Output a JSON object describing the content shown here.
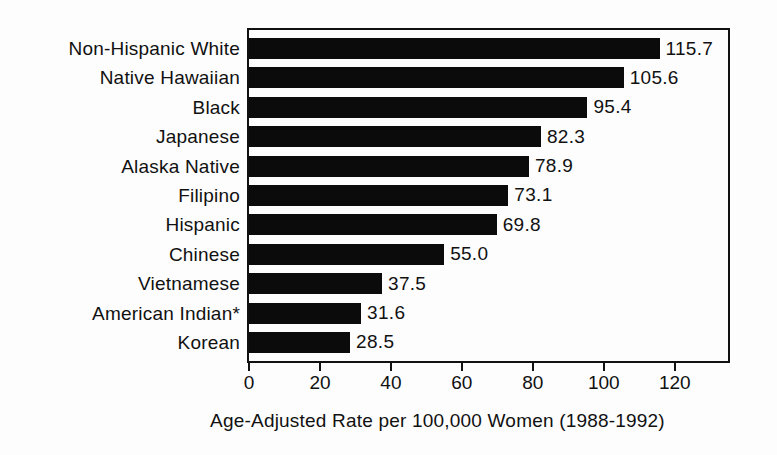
{
  "chart_data": {
    "type": "bar",
    "orientation": "horizontal",
    "categories": [
      "Non-Hispanic White",
      "Native Hawaiian",
      "Black",
      "Japanese",
      "Alaska Native",
      "Filipino",
      "Hispanic",
      "Chinese",
      "Vietnamese",
      "American Indian*",
      "Korean"
    ],
    "values": [
      115.7,
      105.6,
      95.4,
      82.3,
      78.9,
      73.1,
      69.8,
      55.0,
      37.5,
      31.6,
      28.5
    ],
    "value_labels": [
      "115.7",
      "105.6",
      "95.4",
      "82.3",
      "78.9",
      "73.1",
      "69.8",
      "55.0",
      "37.5",
      "31.6",
      "28.5"
    ],
    "title": "",
    "xlabel": "Age-Adjusted Rate per 100,000 Women (1988-1992)",
    "ylabel": "",
    "xticks": [
      0,
      20,
      40,
      60,
      80,
      100,
      120
    ],
    "xtick_labels": [
      "0",
      "20",
      "40",
      "60",
      "80",
      "100",
      "120"
    ],
    "xlim": [
      0,
      135
    ],
    "grid": false,
    "legend_position": "none",
    "bar_color": "#0b0b0b",
    "plot_border_color": "#111111",
    "background_color": "#fdfdfd"
  }
}
